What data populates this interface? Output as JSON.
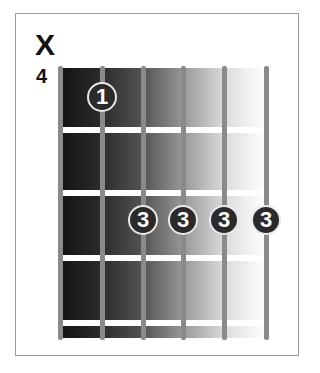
{
  "chord_diagram": {
    "muted_marker": "X",
    "start_fret": "4",
    "strings": 6,
    "frets_shown": 4,
    "fingers": [
      {
        "string": 2,
        "fret_row": 1,
        "finger": "1"
      },
      {
        "string": 3,
        "fret_row": 3,
        "finger": "3"
      },
      {
        "string": 4,
        "fret_row": 3,
        "finger": "3"
      },
      {
        "string": 5,
        "fret_row": 3,
        "finger": "3"
      },
      {
        "string": 6,
        "fret_row": 3,
        "finger": "3"
      }
    ],
    "colors": {
      "board_dark": "#141414",
      "board_light": "#ffffff",
      "string": "#8a8a8a",
      "finger_dot": "#2a2a2a",
      "fret": "#ffffff"
    }
  }
}
